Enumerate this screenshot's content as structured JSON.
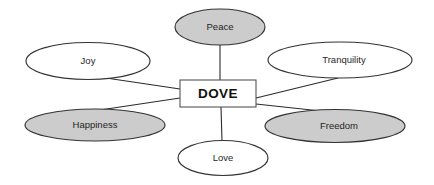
{
  "diagram": {
    "type": "concept-map",
    "title": "DOVE",
    "background_color": "#ffffff",
    "stroke_color": "#333333",
    "connector_color": "#2b2b2b",
    "center": {
      "label": "DOVE",
      "shape": "rectangle",
      "fill": "#ffffff",
      "x": 218,
      "y": 93.5,
      "width": 76,
      "height": 27
    },
    "nodes": [
      {
        "id": "peace",
        "label": "Peace",
        "shape": "ellipse",
        "fill": "#cccccc",
        "shaded": true,
        "cx": 220,
        "cy": 27,
        "rx": 45,
        "ry": 18,
        "position": "top"
      },
      {
        "id": "joy",
        "label": "Joy",
        "shape": "ellipse",
        "fill": "#ffffff",
        "shaded": false,
        "cx": 88,
        "cy": 61,
        "rx": 62,
        "ry": 18.5,
        "position": "upper-left"
      },
      {
        "id": "tranquility",
        "label": "Tranquility",
        "shape": "ellipse",
        "fill": "#ffffff",
        "shaded": false,
        "cx": 340,
        "cy": 60,
        "rx": 72,
        "ry": 18,
        "position": "upper-right"
      },
      {
        "id": "happiness",
        "label": "Happiness",
        "shape": "ellipse",
        "fill": "#cccccc",
        "shaded": true,
        "cx": 95,
        "cy": 125,
        "rx": 70,
        "ry": 16,
        "position": "lower-left"
      },
      {
        "id": "freedom",
        "label": "Freedom",
        "shape": "ellipse",
        "fill": "#cccccc",
        "shaded": true,
        "cx": 335,
        "cy": 126,
        "rx": 70,
        "ry": 16.5,
        "position": "lower-right"
      },
      {
        "id": "love",
        "label": "Love",
        "shape": "ellipse",
        "fill": "#ffffff",
        "shaded": false,
        "cx": 223,
        "cy": 158,
        "rx": 45,
        "ry": 17.5,
        "position": "bottom"
      }
    ],
    "edges": [
      {
        "id": "edge-peace",
        "from": "DOVE",
        "to": "Peace",
        "x1": 220,
        "y1": 80,
        "x2": 220,
        "y2": 45
      },
      {
        "id": "edge-love",
        "from": "DOVE",
        "to": "Love",
        "x1": 221,
        "y1": 107,
        "x2": 222,
        "y2": 141
      },
      {
        "id": "edge-joy",
        "from": "DOVE",
        "to": "Joy",
        "x1": 180,
        "y1": 89,
        "x2": 106,
        "y2": 78
      },
      {
        "id": "edge-happiness",
        "from": "DOVE",
        "to": "Happiness",
        "x1": 180,
        "y1": 98,
        "x2": 100,
        "y2": 110
      },
      {
        "id": "edge-tranquility",
        "from": "DOVE",
        "to": "Tranquility",
        "x1": 256,
        "y1": 98,
        "x2": 338,
        "y2": 78
      },
      {
        "id": "edge-freedom",
        "from": "DOVE",
        "to": "Freedom",
        "x1": 256,
        "y1": 104,
        "x2": 330,
        "y2": 112
      }
    ]
  }
}
